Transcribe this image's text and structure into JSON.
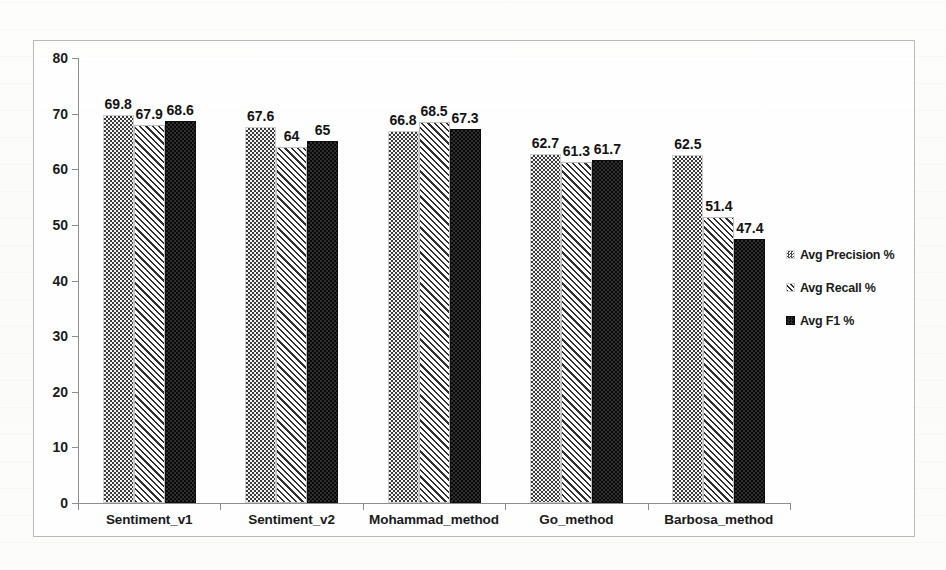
{
  "chart_data": {
    "type": "bar",
    "title": "",
    "xlabel": "",
    "ylabel": "",
    "ylim": [
      0,
      80
    ],
    "y_ticks": [
      0,
      10,
      20,
      30,
      40,
      50,
      60,
      70,
      80
    ],
    "grid": false,
    "legend_position": "right",
    "categories": [
      "Sentiment_v1",
      "Sentiment_v2",
      "Mohammad_method",
      "Go_method",
      "Barbosa_method"
    ],
    "series": [
      {
        "name": "Avg Precision %",
        "pattern": "light-dotted",
        "values": [
          69.8,
          67.6,
          66.8,
          62.7,
          62.5
        ],
        "labels": [
          "69.8",
          "67.6",
          "66.8",
          "62.7",
          "62.5"
        ]
      },
      {
        "name": "Avg Recall %",
        "pattern": "diagonal-hatch",
        "values": [
          67.9,
          64,
          68.5,
          61.3,
          51.4
        ],
        "labels": [
          "67.9",
          "64",
          "68.5",
          "61.3",
          "51.4"
        ]
      },
      {
        "name": "Avg F1 %",
        "pattern": "dark-dotted",
        "values": [
          68.6,
          65,
          67.3,
          61.7,
          47.4
        ],
        "labels": [
          "68.6",
          "65",
          "67.3",
          "61.7",
          "47.4"
        ]
      }
    ]
  },
  "legend": {
    "items": [
      {
        "label": "Avg Precision %",
        "swatch": "light-dotted-swatch"
      },
      {
        "label": "Avg Recall %",
        "swatch": "diagonal-hatch-swatch"
      },
      {
        "label": "Avg F1 %",
        "swatch": "dark-dotted-swatch"
      }
    ]
  },
  "axis": {
    "y_tick_labels": [
      "80",
      "70",
      "60",
      "50",
      "40",
      "30",
      "20",
      "10",
      "0"
    ]
  },
  "colors": {
    "frame": "#b9b9b9",
    "axis": "#8d8d8d",
    "text": "#1a1a1a",
    "precision_fill": "#f2f2f2",
    "recall_fill": "#ffffff",
    "f1_fill": "#141414"
  }
}
